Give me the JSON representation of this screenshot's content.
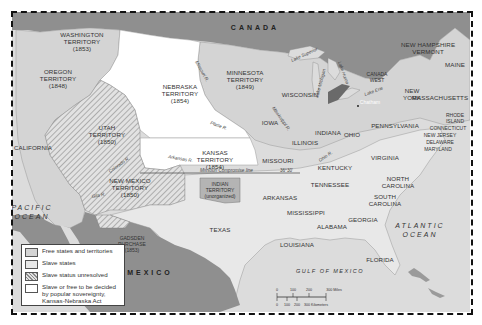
{
  "map": {
    "colors": {
      "foreign": "#8f8f8f",
      "free": "#d4d4d4",
      "slave": "#e8e8e8",
      "unresolved_hatch": "#9a9a9a",
      "popular_sovereignty": "#ffffff",
      "ocean": "#dcdcdc",
      "indian_territory": "#b4b4b4"
    },
    "countries": {
      "canada": "CANADA",
      "mexico": "MEXICO"
    },
    "oceans": {
      "pacific_1": "PACIFIC",
      "pacific_2": "OCEAN",
      "atlantic_1": "ATLANTIC",
      "atlantic_2": "OCEAN",
      "gulf": "GULF OF MEXICO"
    },
    "territories": {
      "washington": [
        "WASHINGTON",
        "TERRITORY",
        "(1853)"
      ],
      "oregon": [
        "OREGON",
        "TERRITORY",
        "(1848)"
      ],
      "nebraska": [
        "NEBRASKA",
        "TERRITORY",
        "(1854)"
      ],
      "minnesota": [
        "MINNESOTA",
        "TERRITORY",
        "(1849)"
      ],
      "utah": [
        "UTAH",
        "TERRITORY",
        "(1850)"
      ],
      "kansas": [
        "KANSAS",
        "TERRITORY",
        "(1854)"
      ],
      "new_mexico": [
        "NEW MEXICO",
        "TERRITORY",
        "(1850)"
      ],
      "indian": [
        "INDIAN",
        "TERRITORY",
        "(unorganized)"
      ],
      "gadsden": [
        "GADSDEN",
        "PURCHASE",
        "(1853)"
      ],
      "canada_west": [
        "CANADA",
        "WEST"
      ]
    },
    "states": {
      "california": "CALIFORNIA",
      "texas": "TEXAS",
      "iowa": "IOWA",
      "wisconsin": "WISCONSIN",
      "illinois": "ILLINOIS",
      "indiana": "INDIANA",
      "ohio": "OHIO",
      "missouri": "MISSOURI",
      "arkansas": "ARKANSAS",
      "louisiana": "LOUISIANA",
      "mississippi": "MISSISSIPPI",
      "alabama": "ALABAMA",
      "georgia": "GEORGIA",
      "florida": "FLORIDA",
      "tennessee": "TENNESSEE",
      "kentucky": "KENTUCKY",
      "virginia": "VIRGINIA",
      "north_carolina_1": "NORTH",
      "north_carolina_2": "CAROLINA",
      "south_carolina_1": "SOUTH",
      "south_carolina_2": "CAROLINA",
      "pennsylvania": "PENNSYLVANIA",
      "new_york_1": "NEW",
      "new_york_2": "YORK",
      "massachusetts": "MASSACHUSETTS",
      "maine": "MAINE",
      "new_hampshire": "NEW HAMPSHIRE",
      "vermont": "VERMONT",
      "rhode_island_1": "RHODE",
      "rhode_island_2": "ISLAND",
      "connecticut": "CONNECTICUT",
      "new_jersey": "NEW JERSEY",
      "delaware": "DELAWARE",
      "maryland": "MARYLAND"
    },
    "places": {
      "chatham": "Chatham"
    },
    "rivers": {
      "missouri": "Missouri R.",
      "mississippi": "Mississippi R.",
      "platte": "Platte R.",
      "arkansas": "Arkansas R.",
      "colorado": "Colorado R.",
      "gila": "Gila R.",
      "ohio": "Ohio R."
    },
    "lakes": {
      "superior": "Lake Superior",
      "michigan": "Lake Michigan",
      "huron": "Lake Huron",
      "erie": "Lake Erie"
    },
    "compromise_line": {
      "label": "Missouri Compromise line",
      "latitude": "36°30'"
    },
    "scale": {
      "miles_ticks": [
        "0",
        "100",
        "200",
        "300 Miles"
      ],
      "km_ticks": [
        "0",
        "100",
        "200",
        "300 Kilometers"
      ]
    }
  },
  "legend": {
    "items": [
      {
        "label": "Free states and territories",
        "swatch": "free"
      },
      {
        "label": "Slave states",
        "swatch": "slave"
      },
      {
        "label": "Slave status unresolved",
        "swatch": "hatched"
      },
      {
        "label": "Slave or free to be decided by popular sovereignty, Kansas-Nebraska Act",
        "swatch": "white"
      }
    ]
  }
}
